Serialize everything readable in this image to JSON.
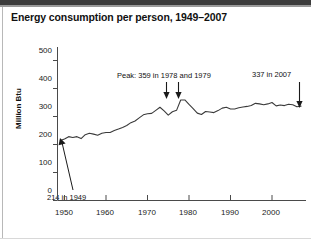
{
  "chart_data": {
    "type": "line",
    "title": "Energy consumption per person, 1949–2007",
    "xlabel": "",
    "ylabel": "Million Btu",
    "xlim": [
      1949,
      2007
    ],
    "ylim": [
      0,
      500
    ],
    "grid": false,
    "legend": "none",
    "x_ticks": [
      "1950",
      "1960",
      "1970",
      "1980",
      "1990",
      "2000"
    ],
    "x_tick_values": [
      1950,
      1960,
      1970,
      1980,
      1990,
      2000
    ],
    "y_ticks": [
      "0",
      "100",
      "200",
      "300",
      "400",
      "500"
    ],
    "y_tick_values": [
      0,
      100,
      200,
      300,
      400,
      500
    ],
    "line_color": "#3a3a3a",
    "series": [
      {
        "name": "Energy consumption per person (Million Btu)",
        "x": [
          1949,
          1950,
          1951,
          1952,
          1953,
          1954,
          1955,
          1956,
          1957,
          1958,
          1959,
          1960,
          1961,
          1962,
          1963,
          1964,
          1965,
          1966,
          1967,
          1968,
          1969,
          1970,
          1971,
          1972,
          1973,
          1974,
          1975,
          1976,
          1977,
          1978,
          1979,
          1980,
          1981,
          1982,
          1983,
          1984,
          1985,
          1986,
          1987,
          1988,
          1989,
          1990,
          1991,
          1992,
          1993,
          1994,
          1995,
          1996,
          1997,
          1998,
          1999,
          2000,
          2001,
          2002,
          2003,
          2004,
          2005,
          2006,
          2007
        ],
        "values": [
          214,
          220,
          228,
          225,
          228,
          221,
          235,
          240,
          237,
          233,
          240,
          243,
          243,
          250,
          255,
          261,
          268,
          278,
          284,
          295,
          306,
          310,
          311,
          322,
          333,
          320,
          305,
          317,
          322,
          359,
          359,
          343,
          328,
          312,
          307,
          318,
          316,
          314,
          321,
          330,
          333,
          327,
          327,
          331,
          334,
          336,
          339,
          347,
          345,
          342,
          345,
          350,
          338,
          341,
          339,
          344,
          342,
          335,
          337
        ]
      }
    ],
    "annotations": [
      {
        "name": "first-point-annotation",
        "text": "214 in 1949",
        "value": 214,
        "year": 1949,
        "arrow": "up-left"
      },
      {
        "name": "peak-annotation",
        "text": "Peak: 359 in 1978 and 1979",
        "value": 359,
        "years": [
          1978,
          1979
        ],
        "arrow": "down"
      },
      {
        "name": "last-point-annotation",
        "text": "337 in 2007",
        "value": 337,
        "year": 2007,
        "arrow": "down"
      }
    ]
  },
  "page": {
    "title": "Energy consumption per person, 1949–2007"
  }
}
